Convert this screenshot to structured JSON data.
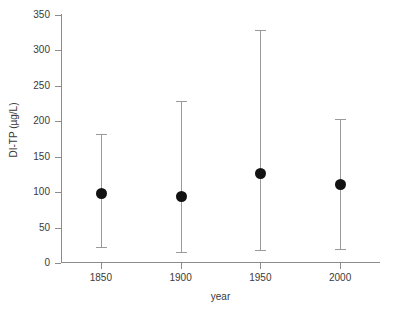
{
  "chart_data": {
    "type": "scatter",
    "title": "",
    "xlabel": "year",
    "ylabel": "DI-TP (µg/L)",
    "xlim": [
      1825,
      2025
    ],
    "ylim": [
      0,
      350
    ],
    "grid": false,
    "legend": "none",
    "x_ticks": [
      "1850",
      "1900",
      "1950",
      "2000"
    ],
    "x_tick_values": [
      1850,
      1900,
      1950,
      2000
    ],
    "y_ticks": [
      "0",
      "50",
      "100",
      "150",
      "200",
      "250",
      "300",
      "350"
    ],
    "y_tick_values": [
      0,
      50,
      100,
      150,
      200,
      250,
      300,
      350
    ],
    "categories": [
      1850,
      1900,
      1950,
      2000
    ],
    "values": [
      99,
      94,
      127,
      112
    ],
    "error_low": [
      22,
      15,
      18,
      20
    ],
    "error_high": [
      182,
      229,
      329,
      203
    ],
    "points": [
      {
        "x": 1850,
        "y": 99,
        "low": 22,
        "high": 182
      },
      {
        "x": 1900,
        "y": 94,
        "low": 15,
        "high": 229
      },
      {
        "x": 1950,
        "y": 127,
        "low": 18,
        "high": 329
      },
      {
        "x": 2000,
        "y": 112,
        "low": 20,
        "high": 203
      }
    ],
    "marker_color": "#121212",
    "errorbar_color": "#9a9a9a",
    "axis_color": "#8c8c8c",
    "background_color": "#ffffff"
  }
}
